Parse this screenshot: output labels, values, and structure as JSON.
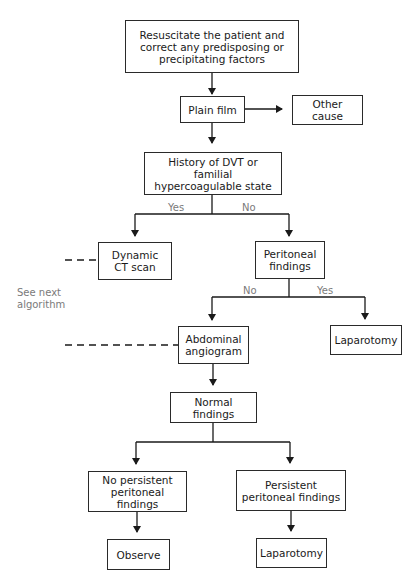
{
  "nodes": {
    "resuscitate": "Resuscitate the patient and correct any predisposing or precipitating factors",
    "plain_film": "Plain film",
    "other_cause": "Other cause",
    "history": "History of DVT or familial hypercoagulable state",
    "dynamic_ct": "Dynamic CT scan",
    "peritoneal_findings": "Peritoneal findings",
    "abdominal_angiogram": "Abdominal angiogram",
    "laparotomy_right": "Laparotomy",
    "normal_findings": "Normal findings",
    "no_persistent": "No persistent peritoneal findings",
    "persistent": "Persistent peritoneal findings",
    "observe": "Observe",
    "laparotomy_bottom": "Laparotomy"
  },
  "edge_labels": {
    "history_yes": "Yes",
    "history_no": "No",
    "peritoneal_no": "No",
    "peritoneal_yes": "Yes"
  },
  "side_note": "See next algorithm"
}
